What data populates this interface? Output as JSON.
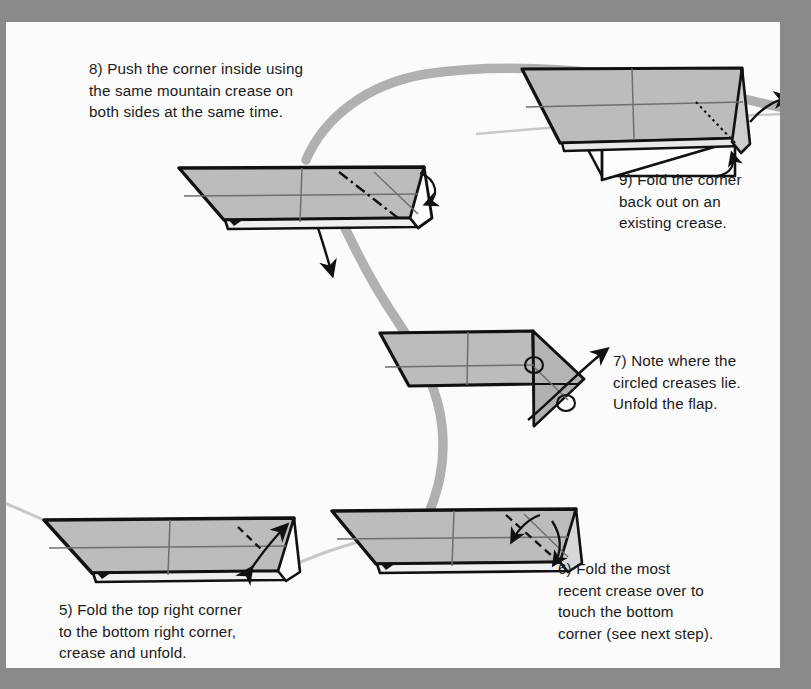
{
  "document": {
    "kind": "origami-instruction-diagram",
    "page_background": "#fbfbfb",
    "border_color": "#8a8a8a"
  },
  "palette": {
    "paper_fill": "#b9b9b9",
    "paper_fill_light": "#c6c6c6",
    "paper_fill_dark": "#a9a9a9",
    "paper_white": "#fdfdfd",
    "outline": "#111111",
    "crease_line": "#6f6f6f",
    "ribbon": "#b0b0b0",
    "thin_flow": "#c8c8c8",
    "text": "#1a1a1a"
  },
  "steps": [
    {
      "id": "step-8",
      "number": "8",
      "text": "8) Push the corner inside using\nthe same mountain crease on\nboth sides at the same time.",
      "figure": "figure-step-8",
      "markings": [
        "mountain-crease-dash-dot",
        "down-arrow",
        "small-curved-arrow"
      ]
    },
    {
      "id": "step-9",
      "number": "9",
      "text": "9) Fold the corner\nback out on an\nexisting crease.",
      "figure": "figure-step-9",
      "markings": [
        "dotted-hidden-crease",
        "out-arrow",
        "small-curved-arrow"
      ]
    },
    {
      "id": "step-7",
      "number": "7",
      "text": "7) Note where the\ncircled creases lie.\nUnfold the flap.",
      "figure": "figure-step-7",
      "markings": [
        "circled-crease-upper",
        "circled-crease-lower",
        "unfold-arrow"
      ]
    },
    {
      "id": "step-6",
      "number": "6",
      "text": "6) Fold the most\nrecent crease over to\ntouch the bottom\ncorner (see next step).",
      "figure": "figure-step-6",
      "markings": [
        "valley-fold-dashed",
        "curved-arrow-left",
        "curved-arrow-down"
      ]
    },
    {
      "id": "step-5",
      "number": "5",
      "text": "5) Fold the top right corner\nto the bottom right corner,\ncrease and unfold.",
      "figure": "figure-step-5",
      "markings": [
        "valley-fold-dashed",
        "double-headed-crease-unfold-arrow"
      ]
    }
  ],
  "flow": {
    "ribbon_label": "thick-gray-sequence-ribbon",
    "thin_label": "thin-gray-sequence-line"
  }
}
